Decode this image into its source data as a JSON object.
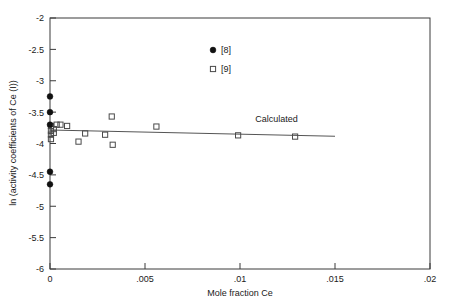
{
  "chart_data": {
    "type": "scatter",
    "title": "",
    "xlabel": "Mole fraction Ce",
    "ylabel": "ln (activity coefficients of Ce (I))",
    "xlim": [
      0,
      0.02
    ],
    "ylim": [
      -6,
      -2
    ],
    "xticks": [
      0,
      0.005,
      0.01,
      0.015,
      0.02
    ],
    "xticklabels": [
      "0",
      ".005",
      ".01",
      ".015",
      ".02"
    ],
    "yticks": [
      -2,
      -2.5,
      -3,
      -3.5,
      -4,
      -4.5,
      -5,
      -5.5,
      -6
    ],
    "yticklabels": [
      "-2",
      "-2.5",
      "-3",
      "-3.5",
      "-4",
      "-4.5",
      "-5",
      "-5.5",
      "-6"
    ],
    "grid": false,
    "legend_position": "top-right-inside",
    "series": [
      {
        "name": "[8]",
        "marker": "filled-circle",
        "color": "#111111",
        "points": [
          {
            "x": 0.0,
            "y": -3.25
          },
          {
            "x": 0.0,
            "y": -3.5
          },
          {
            "x": 0.0,
            "y": -3.7
          },
          {
            "x": 0.0,
            "y": -4.45
          },
          {
            "x": 0.0,
            "y": -4.65
          }
        ]
      },
      {
        "name": "[9]",
        "marker": "open-square",
        "color": "#4a4a4a",
        "points": [
          {
            "x": 5e-05,
            "y": -3.72
          },
          {
            "x": 5e-05,
            "y": -3.8
          },
          {
            "x": 5e-05,
            "y": -3.86
          },
          {
            "x": 5e-05,
            "y": -3.93
          },
          {
            "x": 0.0002,
            "y": -3.77
          },
          {
            "x": 0.0002,
            "y": -3.83
          },
          {
            "x": 0.00035,
            "y": -3.7
          },
          {
            "x": 0.00055,
            "y": -3.7
          },
          {
            "x": 0.0009,
            "y": -3.72
          },
          {
            "x": 0.0015,
            "y": -3.97
          },
          {
            "x": 0.00185,
            "y": -3.84
          },
          {
            "x": 0.0029,
            "y": -3.86
          },
          {
            "x": 0.00325,
            "y": -3.57
          },
          {
            "x": 0.0033,
            "y": -4.02
          },
          {
            "x": 0.0056,
            "y": -3.73
          },
          {
            "x": 0.0099,
            "y": -3.87
          },
          {
            "x": 0.0129,
            "y": -3.89
          }
        ]
      }
    ],
    "fit_line": {
      "label": "Calculated",
      "label_x": 0.0108,
      "label_y": -3.655,
      "points": [
        {
          "x": 0.0,
          "y": -3.785
        },
        {
          "x": 0.015,
          "y": -3.885
        }
      ]
    },
    "legend": [
      {
        "label": "[8]",
        "marker": "filled-circle"
      },
      {
        "label": "[9]",
        "marker": "open-square"
      }
    ]
  }
}
